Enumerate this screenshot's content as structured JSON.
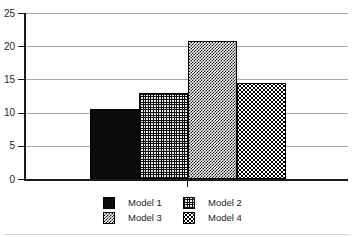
{
  "figure": {
    "background": "#ffffff"
  },
  "chart_data": {
    "type": "bar",
    "title": "",
    "xlabel": "",
    "ylabel": "",
    "categories": [
      "Model 1",
      "Model 2",
      "Model 3",
      "Model 4"
    ],
    "values": [
      10.5,
      13,
      20.8,
      14.5
    ],
    "ylim": [
      0,
      25
    ],
    "yticks": [
      0,
      5,
      10,
      15,
      20,
      25
    ],
    "grid": true,
    "legend_position": "bottom-center",
    "legend": [
      {
        "label": "Model 1",
        "pattern": "solid-black"
      },
      {
        "label": "Model 2",
        "pattern": "grid"
      },
      {
        "label": "Model 3",
        "pattern": "checker"
      },
      {
        "label": "Model 4",
        "pattern": "dots"
      }
    ],
    "colors": {
      "axis": "#1a1a1a",
      "gridline": "#a8a8a8",
      "bar_border": "#000000",
      "text": "#1f1f1f"
    }
  }
}
